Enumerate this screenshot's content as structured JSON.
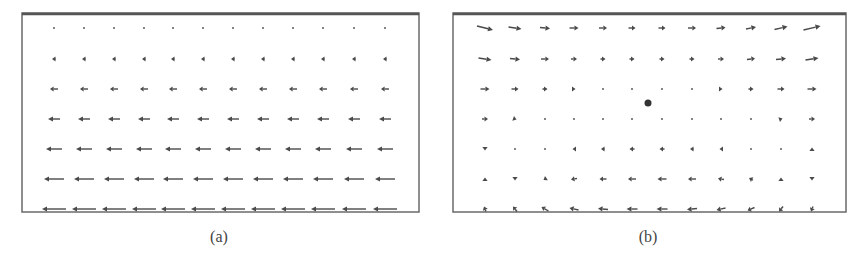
{
  "figure": {
    "panels": [
      {
        "id": "a",
        "caption": "(a)",
        "description": "Uniform leftward flow whose magnitude increases linearly from top (near zero) to bottom",
        "frame": {
          "x": 22,
          "y": 13,
          "w": 397,
          "h": 199
        },
        "columns_x": [
          54,
          84,
          114,
          144,
          173,
          203,
          233,
          263,
          293,
          323,
          354,
          385
        ],
        "rows_y": [
          28,
          59,
          89,
          119,
          149,
          179,
          209
        ],
        "field": {
          "type": "shear",
          "row_vectors": [
            {
              "dx": 0,
              "dy": 0
            },
            {
              "dx": -4,
              "dy": 0
            },
            {
              "dx": -8,
              "dy": 0
            },
            {
              "dx": -12,
              "dy": 0
            },
            {
              "dx": -16,
              "dy": 0
            },
            {
              "dx": -20,
              "dy": 0
            },
            {
              "dx": -24,
              "dy": 0
            }
          ]
        }
      },
      {
        "id": "b",
        "caption": "(b)",
        "description": "Shear flow seen in a frame moving with a vortex-like point; rightward flow on top, leftward at bottom, with a stagnation dot near center",
        "frame": {
          "x": 453,
          "y": 13,
          "w": 393,
          "h": 199
        },
        "columns_x": [
          485,
          515,
          545,
          574,
          603,
          632,
          662,
          692,
          721,
          751,
          781,
          812
        ],
        "rows_y": [
          28,
          59,
          89,
          119,
          149,
          179,
          209
        ],
        "center_dot": {
          "x": 648,
          "y": 103,
          "r": 3.5
        },
        "vectors": [
          [
            [
              16,
              4
            ],
            [
              13,
              2
            ],
            [
              10,
              1
            ],
            [
              9,
              0
            ],
            [
              8,
              0
            ],
            [
              7,
              0
            ],
            [
              7,
              0
            ],
            [
              8,
              0
            ],
            [
              9,
              -1
            ],
            [
              10,
              -2
            ],
            [
              13,
              -3
            ],
            [
              17,
              -4
            ]
          ],
          [
            [
              13,
              2
            ],
            [
              10,
              1
            ],
            [
              8,
              0
            ],
            [
              6,
              0
            ],
            [
              5,
              0
            ],
            [
              5,
              0
            ],
            [
              5,
              0
            ],
            [
              5,
              0
            ],
            [
              6,
              0
            ],
            [
              8,
              -1
            ],
            [
              10,
              -1
            ],
            [
              13,
              -2
            ]
          ],
          [
            [
              9,
              0
            ],
            [
              7,
              0
            ],
            [
              5,
              0
            ],
            [
              3,
              0
            ],
            [
              0,
              0
            ],
            [
              0,
              0
            ],
            [
              0,
              0
            ],
            [
              0,
              0
            ],
            [
              3,
              0
            ],
            [
              5,
              0
            ],
            [
              7,
              0
            ],
            [
              9,
              0
            ]
          ],
          [
            [
              6,
              0
            ],
            [
              3,
              1
            ],
            [
              0,
              0
            ],
            [
              0,
              0
            ],
            [
              0,
              0
            ],
            [
              0,
              0
            ],
            [
              0,
              0
            ],
            [
              0,
              0
            ],
            [
              0,
              0
            ],
            [
              0,
              0
            ],
            [
              3,
              -1
            ],
            [
              6,
              0
            ]
          ],
          [
            [
              0,
              3
            ],
            [
              0,
              0
            ],
            [
              0,
              0
            ],
            [
              -3,
              0
            ],
            [
              -4,
              0
            ],
            [
              -5,
              0
            ],
            [
              -5,
              0
            ],
            [
              -4,
              0
            ],
            [
              -3,
              0
            ],
            [
              0,
              0
            ],
            [
              0,
              0
            ],
            [
              0,
              -3
            ]
          ],
          [
            [
              0,
              -3
            ],
            [
              0,
              3
            ],
            [
              -3,
              2
            ],
            [
              -6,
              1
            ],
            [
              -7,
              0
            ],
            [
              -8,
              0
            ],
            [
              -9,
              0
            ],
            [
              -8,
              0
            ],
            [
              -6,
              -1
            ],
            [
              -4,
              -2
            ],
            [
              0,
              -3
            ],
            [
              0,
              3
            ]
          ],
          [
            [
              -2,
              -5
            ],
            [
              -4,
              -5
            ],
            [
              -7,
              -4
            ],
            [
              -9,
              -2
            ],
            [
              -10,
              -1
            ],
            [
              -11,
              0
            ],
            [
              -11,
              0
            ],
            [
              -10,
              1
            ],
            [
              -9,
              2
            ],
            [
              -7,
              3
            ],
            [
              -4,
              5
            ],
            [
              -2,
              5
            ]
          ]
        ]
      }
    ],
    "colors": {
      "arrow": "#4a4a4a",
      "frame": "#6a6a6a",
      "frame_top": "#555555",
      "dot": "#333333",
      "background": "#ffffff"
    }
  }
}
